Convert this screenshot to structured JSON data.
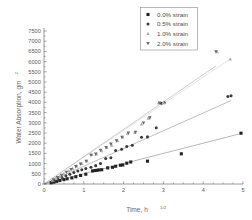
{
  "chart_data": {
    "type": "scatter",
    "title": "",
    "xlabel": "Time,  h",
    "xlabel_sup": "1/2",
    "ylabel": "Water  Absorption, gm",
    "ylabel_sup": "-2",
    "xlim": [
      0,
      5
    ],
    "ylim": [
      0,
      7500
    ],
    "xticks": [
      0,
      1,
      2,
      3,
      4,
      5
    ],
    "xtick_labels": [
      "0",
      "1",
      "2",
      "3",
      "4",
      "5"
    ],
    "yticks": [
      0,
      500,
      1000,
      1500,
      2000,
      2500,
      3000,
      3500,
      4000,
      4500,
      5000,
      5500,
      6000,
      6500,
      7000,
      7500
    ],
    "ytick_labels": [
      "0",
      "500",
      "1000",
      "1500",
      "2000",
      "2500",
      "3000",
      "3500",
      "4000",
      "4500",
      "5000",
      "5500",
      "6000",
      "6500",
      "7000",
      "7500"
    ],
    "grid": false,
    "legend_position": "top-right",
    "series": [
      {
        "name": "0.0% strain",
        "marker": "square",
        "color": "#222222",
        "fit_slope": 500,
        "fit_intercept": 0,
        "points": [
          [
            0.18,
            60
          ],
          [
            0.25,
            95
          ],
          [
            0.32,
            130
          ],
          [
            0.4,
            170
          ],
          [
            0.5,
            215
          ],
          [
            0.58,
            255
          ],
          [
            0.7,
            300
          ],
          [
            0.8,
            355
          ],
          [
            0.92,
            420
          ],
          [
            1.05,
            480
          ],
          [
            1.22,
            640
          ],
          [
            1.28,
            660
          ],
          [
            1.33,
            670
          ],
          [
            1.38,
            690
          ],
          [
            1.45,
            700
          ],
          [
            1.6,
            790
          ],
          [
            1.72,
            820
          ],
          [
            1.8,
            870
          ],
          [
            1.92,
            920
          ],
          [
            1.98,
            935
          ],
          [
            2.08,
            1020
          ],
          [
            2.18,
            1080
          ],
          [
            2.6,
            1120
          ],
          [
            3.45,
            1480
          ],
          [
            4.95,
            2490
          ]
        ]
      },
      {
        "name": "0.5% strain",
        "marker": "circle",
        "color": "#3a3a3a",
        "fit_slope": 870,
        "fit_intercept": 0,
        "points": [
          [
            0.2,
            110
          ],
          [
            0.28,
            180
          ],
          [
            0.35,
            240
          ],
          [
            0.45,
            320
          ],
          [
            0.55,
            400
          ],
          [
            0.65,
            480
          ],
          [
            0.75,
            560
          ],
          [
            0.85,
            640
          ],
          [
            0.95,
            700
          ],
          [
            1.05,
            760
          ],
          [
            1.18,
            820
          ],
          [
            1.3,
            900
          ],
          [
            1.42,
            1010
          ],
          [
            1.55,
            1250
          ],
          [
            1.68,
            1290
          ],
          [
            1.8,
            1640
          ],
          [
            1.95,
            1700
          ],
          [
            2.08,
            1840
          ],
          [
            2.22,
            1900
          ],
          [
            2.45,
            2290
          ],
          [
            2.6,
            2310
          ],
          [
            2.82,
            2760
          ],
          [
            2.95,
            3960
          ],
          [
            3.02,
            3980
          ],
          [
            4.62,
            4290
          ],
          [
            4.7,
            4330
          ]
        ]
      },
      {
        "name": "1.0% strain",
        "marker": "triangle-up",
        "color": "#b0b0b0",
        "fit_slope": 1310,
        "fit_intercept": 0,
        "points": [
          [
            0.22,
            180
          ],
          [
            0.3,
            270
          ],
          [
            0.4,
            380
          ],
          [
            0.5,
            500
          ],
          [
            0.62,
            640
          ],
          [
            0.72,
            760
          ],
          [
            0.82,
            880
          ],
          [
            0.95,
            1000
          ],
          [
            1.08,
            1120
          ],
          [
            1.2,
            1440
          ],
          [
            1.32,
            1470
          ],
          [
            1.45,
            1620
          ],
          [
            1.58,
            1780
          ],
          [
            1.7,
            1900
          ],
          [
            1.85,
            2120
          ],
          [
            1.98,
            2300
          ],
          [
            2.1,
            2480
          ],
          [
            2.28,
            2520
          ],
          [
            2.45,
            2930
          ],
          [
            2.62,
            3220
          ],
          [
            2.88,
            3960
          ],
          [
            3.0,
            3990
          ],
          [
            4.35,
            6480
          ],
          [
            4.68,
            6120
          ]
        ]
      },
      {
        "name": "2.0% strain",
        "marker": "triangle-down",
        "color": "#6a6a6a",
        "fit_slope": 1340,
        "fit_intercept": 0,
        "points": [
          [
            0.24,
            210
          ],
          [
            0.34,
            320
          ],
          [
            0.44,
            440
          ],
          [
            0.56,
            580
          ],
          [
            0.68,
            720
          ],
          [
            0.8,
            860
          ],
          [
            0.92,
            980
          ],
          [
            1.06,
            1120
          ],
          [
            1.18,
            1420
          ],
          [
            1.3,
            1480
          ],
          [
            1.42,
            1660
          ],
          [
            1.56,
            1800
          ],
          [
            1.68,
            1960
          ],
          [
            1.82,
            2120
          ],
          [
            1.96,
            2300
          ],
          [
            2.12,
            2500
          ],
          [
            2.3,
            2540
          ],
          [
            2.5,
            3000
          ],
          [
            2.66,
            3250
          ],
          [
            2.9,
            3980
          ],
          [
            4.32,
            6490
          ]
        ]
      }
    ]
  },
  "legend": {
    "items": [
      {
        "label": "0.0% strain",
        "marker": "square"
      },
      {
        "label": "0.5% strain",
        "marker": "circle"
      },
      {
        "label": "1.0% strain",
        "marker": "triangle-up"
      },
      {
        "label": "2.0% strain",
        "marker": "triangle-down"
      }
    ]
  },
  "colors": {
    "axis": "#808080",
    "text": "#5a5a5a",
    "background": "#ffffff"
  }
}
